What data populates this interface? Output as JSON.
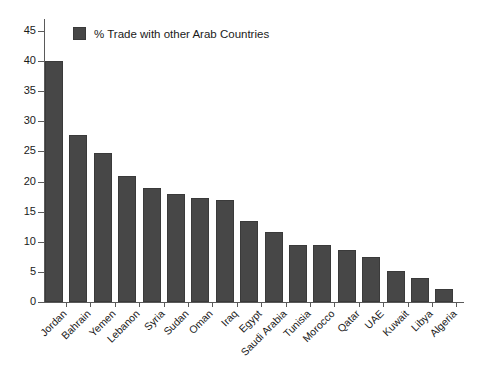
{
  "chart_data": {
    "type": "bar",
    "title": "",
    "xlabel": "",
    "ylabel": "",
    "ylim": [
      0,
      45
    ],
    "ytick_step": 5,
    "yticks": [
      0,
      5,
      10,
      15,
      20,
      25,
      30,
      35,
      40,
      45
    ],
    "grid": false,
    "legend_position": "top-left-inside",
    "series": [
      {
        "name": "% Trade with other Arab Countries",
        "color": "#474747",
        "values": [
          40.1,
          27.7,
          24.7,
          20.9,
          18.9,
          18.0,
          17.3,
          17.0,
          13.4,
          11.7,
          9.5,
          9.4,
          8.7,
          7.4,
          5.2,
          4.0,
          2.1
        ]
      }
    ],
    "categories": [
      "Jordan",
      "Bahrain",
      "Yemen",
      "Lebanon",
      "Syria",
      "Sudan",
      "Oman",
      "Iraq",
      "Egypt",
      "Saudi Arabia",
      "Tunisia",
      "Morocco",
      "Qatar",
      "UAE",
      "Kuwait",
      "Libya",
      "Algeria"
    ]
  },
  "legend": {
    "label": "% Trade with other Arab Countries"
  },
  "colors": {
    "bar": "#474747",
    "bar_edge": "#3a3a3a",
    "axis": "#5a5a5a",
    "text": "#1a1a1a",
    "background": "#ffffff"
  }
}
